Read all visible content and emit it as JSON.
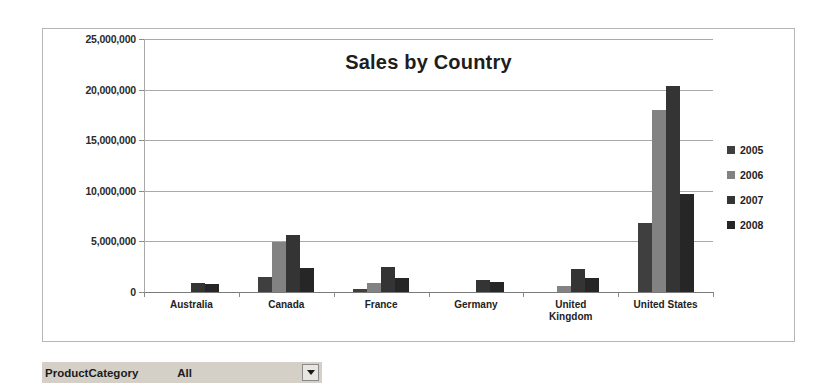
{
  "chart_data": {
    "type": "bar",
    "title": "Sales by Country",
    "xlabel": "",
    "ylabel": "",
    "ylim": [
      0,
      25000000
    ],
    "yticks": [
      0,
      5000000,
      10000000,
      15000000,
      20000000,
      25000000
    ],
    "ytick_labels": [
      "0",
      "5,000,000",
      "10,000,000",
      "15,000,000",
      "20,000,000",
      "25,000,000"
    ],
    "grid": true,
    "legend_position": "right",
    "categories": [
      "Australia",
      "Canada",
      "France",
      "Germany",
      "United Kingdom",
      "United States"
    ],
    "category_label_lines": [
      [
        "Australia"
      ],
      [
        "Canada"
      ],
      [
        "France"
      ],
      [
        "Germany"
      ],
      [
        "United",
        "Kingdom"
      ],
      [
        "United States"
      ]
    ],
    "series": [
      {
        "name": "2005",
        "color": "#3f3f3f",
        "values": [
          0,
          1500000,
          300000,
          0,
          0,
          6800000
        ]
      },
      {
        "name": "2006",
        "color": "#828282",
        "values": [
          0,
          4900000,
          900000,
          0,
          550000,
          17950000
        ]
      },
      {
        "name": "2007",
        "color": "#343434",
        "values": [
          850000,
          5600000,
          2500000,
          1200000,
          2300000,
          20400000
        ]
      },
      {
        "name": "2008",
        "color": "#262626",
        "values": [
          780000,
          2400000,
          1400000,
          1000000,
          1400000,
          9700000
        ]
      }
    ]
  },
  "parameter_bar": {
    "label": "ProductCategory",
    "value": "All",
    "dropdown_icon": "chevron-down-icon"
  }
}
